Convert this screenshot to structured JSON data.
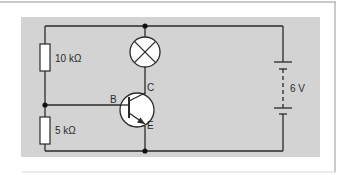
{
  "diagram": {
    "type": "circuit",
    "colors": {
      "background": "#ffffff",
      "panel": "#d3d3d3",
      "wire": "#2a2a2a",
      "frame_line": "#b8b8b8",
      "component_fill": "#ffffff"
    },
    "components": {
      "resistor_top": {
        "label": "10 kΩ"
      },
      "resistor_bottom": {
        "label": "5 kΩ"
      },
      "lamp": {
        "label": ""
      },
      "transistor": {
        "base": "B",
        "collector": "C",
        "emitter": "E"
      },
      "battery": {
        "label": "6 V"
      }
    }
  }
}
